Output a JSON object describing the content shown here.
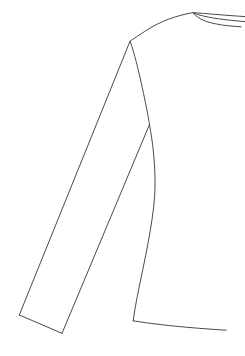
{
  "document": {
    "title": "Garment Technical Flat Sketch",
    "subject": "long-sleeve-top-side-view",
    "background_color": "#ffffff",
    "canvas": {
      "width": 245,
      "height": 356
    }
  },
  "style": {
    "line_color": "#4a4a4a",
    "line_color_light": "#5a5a5a",
    "line_width": "1",
    "line_width_thin": "0.9",
    "fill": "none"
  },
  "drawing": {
    "name": "garment-flat-sketch",
    "description": "Line-art technical flat of a long sleeve garment viewed from the side, showing collar band, shoulder seam, sleeve, armhole seam, side seam and hem.",
    "parts": [
      {
        "id": "collar-line-top",
        "name": "collar-line-top",
        "label": "Collar top edge",
        "type": "path",
        "d": "M 193.2 12.6 C 206 13.6 224 15.2 245.0 16.6",
        "stroke": "#4a4a4a",
        "stroke_width": "1"
      },
      {
        "id": "collar-line-middle",
        "name": "collar-line-middle",
        "label": "Collar middle edge",
        "type": "path",
        "d": "M 193.4 13.1 C 202.5 16.4 216.0 19.3 245.0 21.6",
        "stroke": "#4a4a4a",
        "stroke_width": "1"
      },
      {
        "id": "collar-line-bottom",
        "name": "collar-line-bottom",
        "label": "Collar inner neckline",
        "type": "path",
        "d": "M 193.6 13.6 C 199.5 20.0 210.0 25.0 241.0 26.8",
        "stroke": "#4a4a4a",
        "stroke_width": "1"
      },
      {
        "id": "shoulder-seam",
        "name": "shoulder-seam",
        "label": "Shoulder seam",
        "type": "path",
        "d": "M 193.2 12.6 C 176.0 15.5 160.0 21.5 147.0 30.0 C 139.0 35.2 133.5 38.8 130.0 41.3",
        "stroke": "#4a4a4a",
        "stroke_width": "1"
      },
      {
        "id": "sleeve-top-seam",
        "name": "sleeve-top-seam",
        "label": "Sleeve outer seam",
        "type": "path",
        "d": "M 130.0 41.3 L 19.3 315.0",
        "stroke": "#4a4a4a",
        "stroke_width": "1"
      },
      {
        "id": "sleeve-cuff",
        "name": "sleeve-cuff",
        "label": "Sleeve cuff edge",
        "type": "path",
        "d": "M 19.3 315.0 L 62.0 333.3",
        "stroke": "#4a4a4a",
        "stroke_width": "1"
      },
      {
        "id": "sleeve-under-seam",
        "name": "sleeve-under-seam",
        "label": "Sleeve under seam",
        "type": "path",
        "d": "M 62.0 333.3 L 149.5 124.5",
        "stroke": "#4a4a4a",
        "stroke_width": "1"
      },
      {
        "id": "armhole-seam",
        "name": "armhole-seam",
        "label": "Armhole / raglan seam",
        "type": "path",
        "d": "M 130.3 41.8 C 134.5 53.0 141.0 80.0 146.5 108.0 C 148.0 115.5 149.0 121.0 149.5 124.5",
        "stroke": "#4a4a4a",
        "stroke_width": "1"
      },
      {
        "id": "side-seam",
        "name": "side-seam",
        "label": "Body side seam",
        "type": "path",
        "d": "M 149.5 124.5 C 152.5 141.0 155.5 163.5 155.0 188.0 C 154.5 212.0 148.0 245.0 140.0 283.0 C 136.5 299.5 134.2 313.0 133.2 320.8",
        "stroke": "#4a4a4a",
        "stroke_width": "1"
      },
      {
        "id": "hem-line",
        "name": "hem-line",
        "label": "Body hem line",
        "type": "path",
        "d": "M 133.2 320.8 C 155.0 324.5 190.0 328.0 226.0 330.2",
        "stroke": "#4a4a4a",
        "stroke_width": "1"
      }
    ]
  }
}
